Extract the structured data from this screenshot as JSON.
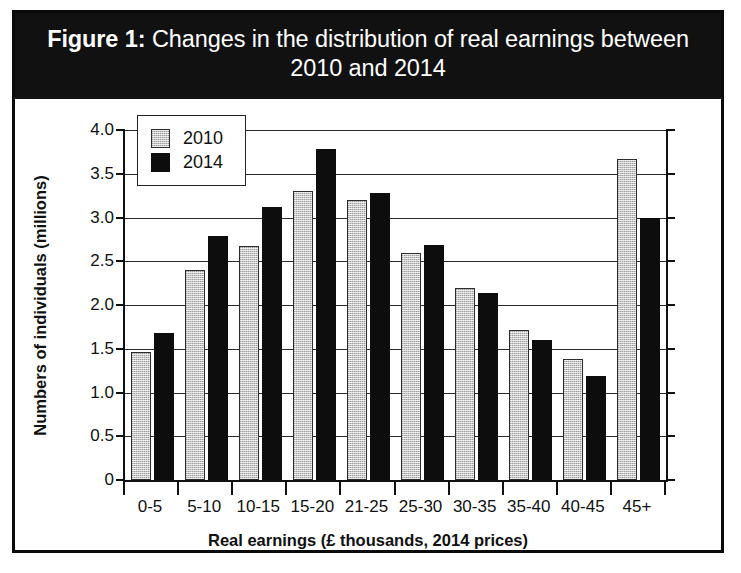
{
  "figure": {
    "label": "Figure 1:",
    "title": "Changes in the distribution of real earnings between 2010 and 2014",
    "title_line1": "Figure 1: Changes in the distribution of real",
    "title_line2": "earnings between 2010 and 2014",
    "banner_color": "#111111",
    "banner_text_color": "#ffffff",
    "border_color": "#0a0a0a"
  },
  "chart_data": {
    "type": "bar",
    "title": "Figure 1: Changes in the distribution of real earnings between 2010 and 2014",
    "xlabel": "Real earnings (£ thousands, 2014 prices)",
    "ylabel": "Numbers of individuals (millions)",
    "categories": [
      "0-5",
      "5-10",
      "10-15",
      "15-20",
      "21-25",
      "25-30",
      "30-35",
      "35-40",
      "40-45",
      "45+"
    ],
    "series": [
      {
        "name": "2010",
        "color": "#c8c8c8",
        "values": [
          1.46,
          2.4,
          2.67,
          3.3,
          3.2,
          2.6,
          2.19,
          1.72,
          1.38,
          3.67
        ]
      },
      {
        "name": "2014",
        "color": "#0d0d0d",
        "values": [
          1.68,
          2.79,
          3.12,
          3.78,
          3.28,
          2.69,
          2.14,
          1.6,
          1.19,
          2.99
        ]
      }
    ],
    "ylim": [
      0,
      4.0
    ],
    "yticks": [
      0,
      0.5,
      1.0,
      1.5,
      2.0,
      2.5,
      3.0,
      3.5,
      4.0
    ],
    "ytick_labels": [
      "0",
      "0.5",
      "1.0",
      "1.5",
      "2.0",
      "2.5",
      "3.0",
      "3.5",
      "4.0"
    ],
    "grid": true,
    "legend_position": "upper-left-inside"
  }
}
